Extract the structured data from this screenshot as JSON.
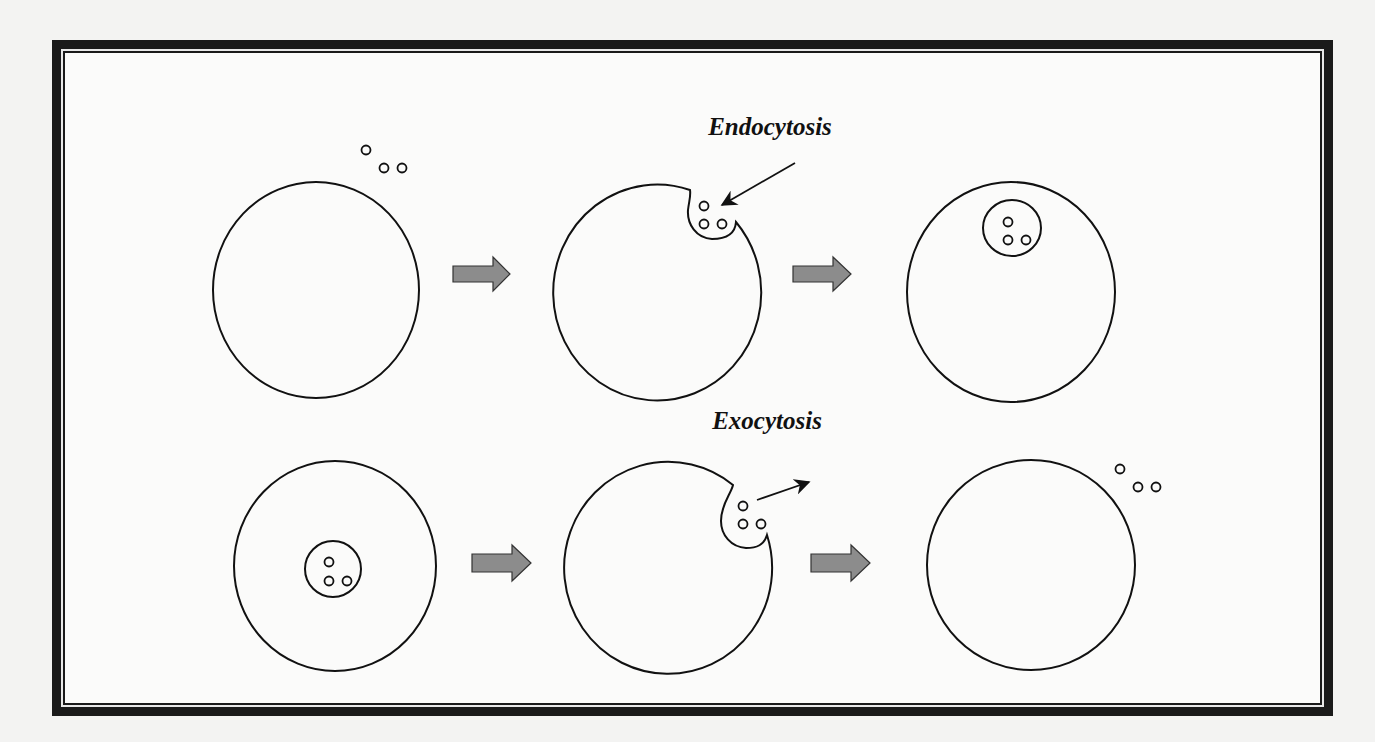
{
  "diagram": {
    "type": "biology-process",
    "colors": {
      "frame": "#1a1a1a",
      "background": "#f3f3f2",
      "panel": "#fbfbfa",
      "stroke": "#111111",
      "process_arrow_fill": "#8c8c8c"
    },
    "rows": [
      {
        "title": "Endocytosis",
        "stages": [
          "Particles outside cell",
          "Membrane invaginates around particles",
          "Vesicle containing particles inside cell"
        ]
      },
      {
        "title": "Exocytosis",
        "stages": [
          "Vesicle containing particles inside cell",
          "Vesicle fuses with membrane, particles released",
          "Particles outside cell"
        ]
      }
    ]
  }
}
